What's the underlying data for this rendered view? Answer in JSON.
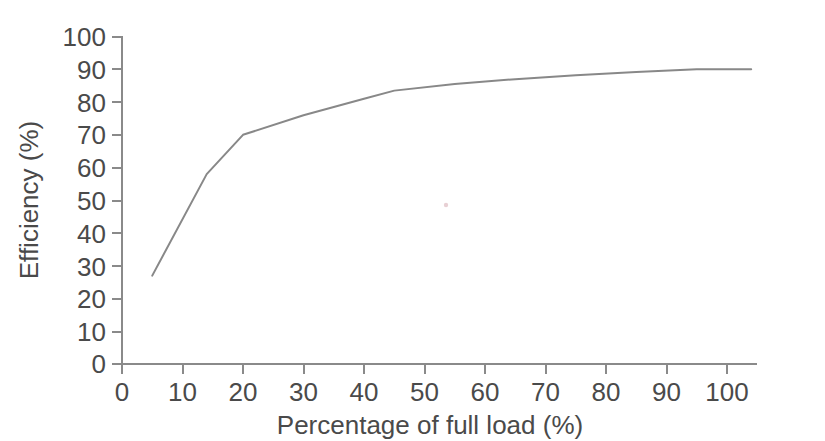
{
  "chart_data": {
    "type": "line",
    "title": "",
    "subtitle": "",
    "xlabel": "Percentage of full load (%)",
    "ylabel": "Efficiency (%)",
    "xlim": [
      -5,
      108
    ],
    "ylim": [
      0,
      100
    ],
    "xticks": [
      0,
      10,
      20,
      30,
      40,
      50,
      60,
      70,
      80,
      90,
      100
    ],
    "yticks": [
      0,
      10,
      20,
      30,
      40,
      50,
      60,
      70,
      80,
      90,
      100
    ],
    "xtick_labels": [
      "0",
      "10",
      "20",
      "30",
      "40",
      "50",
      "60",
      "70",
      "80",
      "90",
      "100"
    ],
    "ytick_labels": [
      "0",
      "10",
      "20",
      "30",
      "40",
      "50",
      "60",
      "70",
      "80",
      "90",
      "100"
    ],
    "grid": false,
    "legend": null,
    "legend_position": "none",
    "series": [
      {
        "name": "Efficiency",
        "color": "#888888",
        "x": [
          5,
          14,
          20,
          30,
          40,
          45,
          55,
          65,
          75,
          85,
          95,
          104
        ],
        "values": [
          27,
          58,
          70,
          76,
          81,
          83.5,
          85.5,
          87,
          88.2,
          89.2,
          90,
          90
        ]
      }
    ],
    "annotations": []
  },
  "axes": {
    "y_title": "Efficiency (%)",
    "x_title": "Percentage of full load (%)",
    "y_tick_text": [
      "100",
      "90",
      "80",
      "70",
      "60",
      "50",
      "40",
      "30",
      "20",
      "10",
      "0"
    ],
    "x_tick_text": [
      "0",
      "10",
      "20",
      "30",
      "40",
      "50",
      "60",
      "70",
      "80",
      "90",
      "100"
    ]
  },
  "colors": {
    "background": "#ffffff",
    "axis": "#8a8a8a",
    "text": "#4a4a4a",
    "line": "#888888",
    "speck": "#e8d0d4"
  }
}
